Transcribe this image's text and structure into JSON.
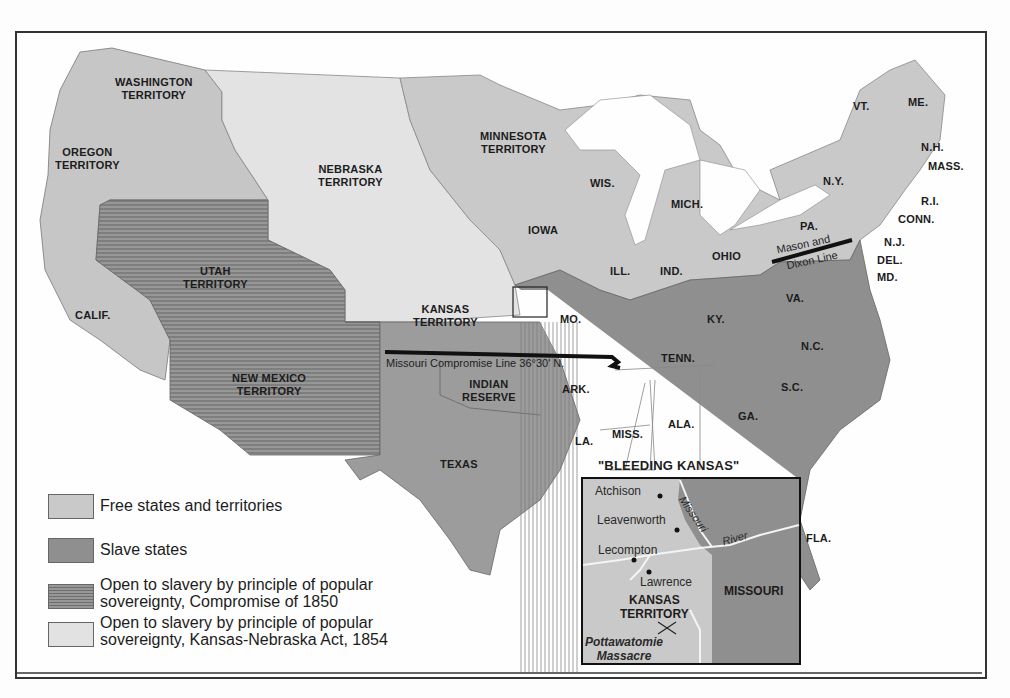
{
  "colors": {
    "free": "#c9c9c9",
    "slave": "#8e8e8e",
    "compromise_1850": "#8a8a8a",
    "kansas_nebraska": "#e2e2e2",
    "water": "#fefefe",
    "line": "#111111"
  },
  "map": {
    "territories": {
      "washington": "WASHINGTON\nTERRITORY",
      "oregon": "OREGON\nTERRITORY",
      "nebraska": "NEBRASKA\nTERRITORY",
      "minnesota": "MINNESOTA\nTERRITORY",
      "utah": "UTAH\nTERRITORY",
      "kansas": "KANSAS\nTERRITORY",
      "new_mexico": "NEW MEXICO\nTERRITORY",
      "indian_reserve": "INDIAN\nRESERVE"
    },
    "states": {
      "calif": "CALIF.",
      "texas": "TEXAS",
      "iowa": "IOWA",
      "wis": "WIS.",
      "mich": "MICH.",
      "ill": "ILL.",
      "ind": "IND.",
      "ohio": "OHIO",
      "mo": "MO.",
      "ky": "KY.",
      "tenn": "TENN.",
      "ark": "ARK.",
      "la": "LA.",
      "miss": "MISS.",
      "ala": "ALA.",
      "ga": "GA.",
      "sc": "S.C.",
      "nc": "N.C.",
      "va": "VA.",
      "pa": "PA.",
      "ny": "N.Y.",
      "vt": "VT.",
      "me": "ME.",
      "nh": "N.H.",
      "mass": "MASS.",
      "ri": "R.I.",
      "conn": "CONN.",
      "nj": "N.J.",
      "del": "DEL.",
      "md": "MD.",
      "fla": "FLA."
    },
    "lines": {
      "missouri_compromise": "Missouri Compromise Line 36°30' N.",
      "mason_dixon_1": "Mason and",
      "mason_dixon_2": "Dixon Line"
    }
  },
  "inset": {
    "title": "\"BLEEDING KANSAS\"",
    "places": {
      "atchison": "Atchison",
      "leavenworth": "Leavenworth",
      "lecompton": "Lecompton",
      "lawrence": "Lawrence"
    },
    "kansas_territory": "KANSAS\nTERRITORY",
    "missouri": "MISSOURI",
    "river_1": "Missouri",
    "river_2": "River",
    "massacre": "Pottawatomie\nMassacre"
  },
  "legend": {
    "items": [
      {
        "label": "Free states and territories"
      },
      {
        "label": "Slave states"
      },
      {
        "label": "Open to slavery by principle of popular\nsovereignty, Compromise of 1850"
      },
      {
        "label": "Open to slavery by principle of popular\nsovereignty, Kansas-Nebraska Act, 1854"
      }
    ]
  }
}
